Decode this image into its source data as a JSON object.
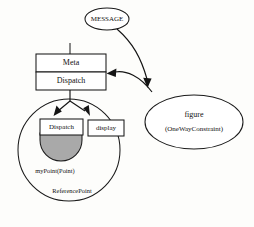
{
  "diagram": {
    "background_color": "#fdfdfb",
    "stroke_color": "#1a1a1a",
    "shaded_fill_color": "#a9a9a9",
    "nodes": {
      "message_ellipse": {
        "label": "MESSAGE",
        "shape": "ellipse",
        "cx": 107,
        "cy": 19,
        "rx": 22,
        "ry": 11
      },
      "meta_box": {
        "label": "Meta",
        "shape": "rect",
        "x": 36,
        "y": 54,
        "w": 70,
        "h": 18
      },
      "dispatch_box": {
        "label": "Dispatch",
        "shape": "rect",
        "x": 36,
        "y": 72,
        "w": 70,
        "h": 18
      },
      "reference_point_circle": {
        "label": "ReferencePoint",
        "shape": "circle",
        "cx": 69,
        "cy": 150,
        "r": 51
      },
      "inner_dispatch_box": {
        "label": "Dispatch",
        "shape": "rect",
        "x": 40,
        "y": 119,
        "w": 43,
        "h": 16
      },
      "display_box": {
        "label": "display",
        "shape": "rect",
        "x": 88,
        "y": 120,
        "w": 36,
        "h": 16
      },
      "mypoint_disc": {
        "label": "myPoint(Point)",
        "shape": "half-disc",
        "cx": 61,
        "cy": 135,
        "r": 21
      },
      "figure_ellipse": {
        "label_line_1": "figure",
        "label_line_2": "(OneWayConstraint)",
        "shape": "ellipse",
        "cx": 194,
        "cy": 122,
        "rx": 49,
        "ry": 27
      }
    },
    "connectors": [
      {
        "name": "meta-stem",
        "from": "top-stem",
        "to": "meta_box",
        "arrow": false
      },
      {
        "name": "message-to-figure",
        "from": "message_ellipse",
        "to": "figure_ellipse",
        "arrow": true
      },
      {
        "name": "figure-to-dispatch",
        "from": "figure_ellipse",
        "to": "dispatch_box",
        "arrow": true
      },
      {
        "name": "dispatch-to-inner-dispatch",
        "from": "dispatch_box",
        "to": "inner_dispatch_box",
        "arrow": true
      },
      {
        "name": "dispatch-to-display",
        "from": "dispatch_box",
        "to": "display_box",
        "arrow": true
      }
    ]
  }
}
